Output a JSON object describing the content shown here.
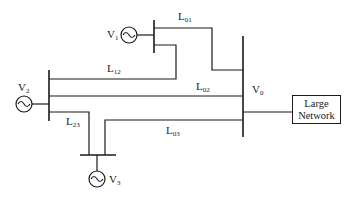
{
  "diagram": {
    "type": "power-system-one-line",
    "generators": [
      {
        "id": "V1",
        "base": "V",
        "sub": "1"
      },
      {
        "id": "V2",
        "base": "V",
        "sub": "2"
      },
      {
        "id": "V3",
        "base": "V",
        "sub": "3"
      }
    ],
    "buses": {
      "v0": {
        "base": "V",
        "sub": "0"
      }
    },
    "lines": {
      "l01": {
        "base": "L",
        "sub": "01"
      },
      "l12": {
        "base": "L",
        "sub": "12"
      },
      "l02": {
        "base": "L",
        "sub": "02"
      },
      "l23": {
        "base": "L",
        "sub": "23"
      },
      "l03": {
        "base": "L",
        "sub": "03"
      }
    },
    "network_box": {
      "line1": "Large",
      "line2": "Network"
    }
  }
}
